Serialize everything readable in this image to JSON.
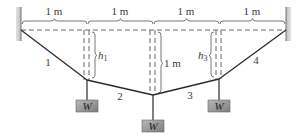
{
  "diagram": {
    "spans": [
      {
        "label": "1 m"
      },
      {
        "label": "1 m"
      },
      {
        "label": "1 m"
      },
      {
        "label": "1 m"
      }
    ],
    "cables": [
      {
        "label": "1"
      },
      {
        "label": "2"
      },
      {
        "label": "3"
      },
      {
        "label": "4"
      }
    ],
    "heights": {
      "h1": {
        "label": "h",
        "sub": "1"
      },
      "h2": {
        "label": "1 m"
      },
      "h3": {
        "label": "h",
        "sub": "3"
      }
    },
    "weights": [
      {
        "label": "W"
      },
      {
        "label": "W"
      },
      {
        "label": "W"
      }
    ],
    "colors": {
      "line": "#2b2b2b",
      "dash": "#555555",
      "wall": "#cfcfcf",
      "weight_fill": "#9a9a9a",
      "text": "#3a3a3a"
    }
  }
}
